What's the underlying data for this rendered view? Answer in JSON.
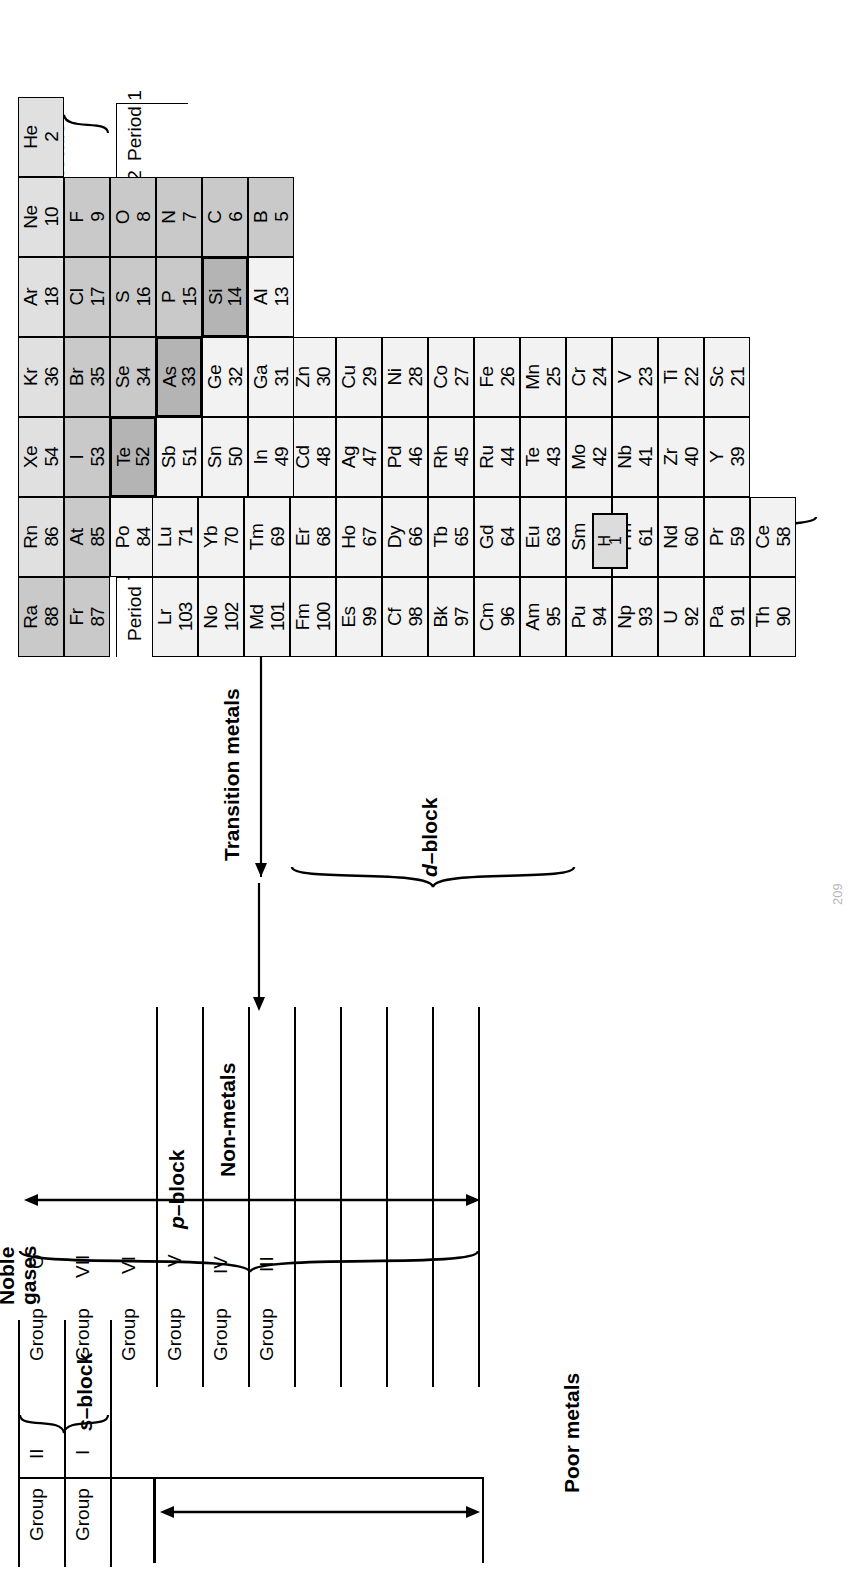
{
  "document": {
    "title": "Periodic Table of the Elements",
    "page_number": "209"
  },
  "group_labels": [
    {
      "word": "Group",
      "numeral": "I"
    },
    {
      "word": "Group",
      "numeral": "II"
    },
    {
      "word": "Group",
      "numeral": "III"
    },
    {
      "word": "Group",
      "numeral": "IV"
    },
    {
      "word": "Group",
      "numeral": "V"
    },
    {
      "word": "Group",
      "numeral": "VI"
    },
    {
      "word": "Group",
      "numeral": "VII"
    },
    {
      "word": "Group",
      "numeral": "O"
    }
  ],
  "period_labels": [
    "Period 1",
    "Period 2",
    "Period 3",
    "Period 4",
    "Period 5",
    "Period 6",
    "Period 7"
  ],
  "block_labels": {
    "s_block": "s-block",
    "p_block": "p-block",
    "d_block": "d-block",
    "f_block": "f-block"
  },
  "category_labels": {
    "reactive_metals": "Reactive\nmetals",
    "reactive_metals_line1": "Reactive",
    "reactive_metals_line2": "metals",
    "transition_metals": "Transition metals",
    "poor_metals": "Poor metals",
    "non_metals": "Non-metals",
    "noble_gases_line1": "Noble",
    "noble_gases_line2": "gases"
  },
  "colors": {
    "reactive_metal_fill": "#c9c9c9",
    "non_metal_fill": "#c9c9c9",
    "noble_gas_fill": "#e0e0e0",
    "poor_metal_fill": "#e0e0e0",
    "transition_fill": "#f2f2f2",
    "metalloid_fill": "#b4b4b4",
    "border": "#000000",
    "background": "#ffffff"
  },
  "chart_data": {
    "type": "table",
    "orientation": "rotated-90-counterclockwise",
    "groups": [
      "I",
      "II",
      "III",
      "IV",
      "V",
      "VI",
      "VII",
      "O"
    ],
    "periods": [
      "Period 1",
      "Period 2",
      "Period 3",
      "Period 4",
      "Period 5",
      "Period 6",
      "Period 7"
    ],
    "main_table": {
      "period1": [
        {
          "symbol": "H",
          "number": "1",
          "col": 1,
          "fill": "light",
          "standalone": true
        },
        {
          "symbol": "He",
          "number": "2",
          "col": 18,
          "fill": "noble"
        }
      ],
      "period2": [
        {
          "symbol": "Li",
          "number": "3",
          "col": 1,
          "fill": "mid"
        },
        {
          "symbol": "Be",
          "number": "4",
          "col": 2,
          "fill": "mid"
        },
        {
          "symbol": "B",
          "number": "5",
          "col": 13,
          "fill": "mid"
        },
        {
          "symbol": "C",
          "number": "6",
          "col": 14,
          "fill": "mid"
        },
        {
          "symbol": "N",
          "number": "7",
          "col": 15,
          "fill": "mid"
        },
        {
          "symbol": "O",
          "number": "8",
          "col": 16,
          "fill": "mid"
        },
        {
          "symbol": "F",
          "number": "9",
          "col": 17,
          "fill": "mid"
        },
        {
          "symbol": "Ne",
          "number": "10",
          "col": 18,
          "fill": "noble"
        }
      ],
      "period3": [
        {
          "symbol": "Na",
          "number": "11",
          "col": 1,
          "fill": "mid"
        },
        {
          "symbol": "Mg",
          "number": "12",
          "col": 2,
          "fill": "mid"
        },
        {
          "symbol": "Al",
          "number": "13",
          "col": 13,
          "fill": "light"
        },
        {
          "symbol": "Si",
          "number": "14",
          "col": 14,
          "fill": "dark"
        },
        {
          "symbol": "P",
          "number": "15",
          "col": 15,
          "fill": "mid"
        },
        {
          "symbol": "S",
          "number": "16",
          "col": 16,
          "fill": "mid"
        },
        {
          "symbol": "Cl",
          "number": "17",
          "col": 17,
          "fill": "mid"
        },
        {
          "symbol": "Ar",
          "number": "18",
          "col": 18,
          "fill": "noble"
        }
      ],
      "period4": [
        {
          "symbol": "K",
          "number": "19",
          "col": 1,
          "fill": "mid"
        },
        {
          "symbol": "Ca",
          "number": "20",
          "col": 2,
          "fill": "mid"
        },
        {
          "symbol": "Sc",
          "number": "21",
          "col": 3,
          "fill": "light"
        },
        {
          "symbol": "Ti",
          "number": "22",
          "col": 4,
          "fill": "light"
        },
        {
          "symbol": "V",
          "number": "23",
          "col": 5,
          "fill": "light"
        },
        {
          "symbol": "Cr",
          "number": "24",
          "col": 6,
          "fill": "light"
        },
        {
          "symbol": "Mn",
          "number": "25",
          "col": 7,
          "fill": "light"
        },
        {
          "symbol": "Fe",
          "number": "26",
          "col": 8,
          "fill": "light"
        },
        {
          "symbol": "Co",
          "number": "27",
          "col": 9,
          "fill": "light"
        },
        {
          "symbol": "Ni",
          "number": "28",
          "col": 10,
          "fill": "light"
        },
        {
          "symbol": "Cu",
          "number": "29",
          "col": 11,
          "fill": "light"
        },
        {
          "symbol": "Zn",
          "number": "30",
          "col": 12,
          "fill": "light"
        },
        {
          "symbol": "Ga",
          "number": "31",
          "col": 13,
          "fill": "light"
        },
        {
          "symbol": "Ge",
          "number": "32",
          "col": 14,
          "fill": "light"
        },
        {
          "symbol": "As",
          "number": "33",
          "col": 15,
          "fill": "dark"
        },
        {
          "symbol": "Se",
          "number": "34",
          "col": 16,
          "fill": "mid"
        },
        {
          "symbol": "Br",
          "number": "35",
          "col": 17,
          "fill": "mid"
        },
        {
          "symbol": "Kr",
          "number": "36",
          "col": 18,
          "fill": "noble"
        }
      ],
      "period5": [
        {
          "symbol": "Rb",
          "number": "37",
          "col": 1,
          "fill": "mid"
        },
        {
          "symbol": "Sr",
          "number": "38",
          "col": 2,
          "fill": "mid"
        },
        {
          "symbol": "Y",
          "number": "39",
          "col": 3,
          "fill": "light"
        },
        {
          "symbol": "Zr",
          "number": "40",
          "col": 4,
          "fill": "light"
        },
        {
          "symbol": "Nb",
          "number": "41",
          "col": 5,
          "fill": "light"
        },
        {
          "symbol": "Mo",
          "number": "42",
          "col": 6,
          "fill": "light"
        },
        {
          "symbol": "Te",
          "number": "43",
          "col": 7,
          "fill": "light"
        },
        {
          "symbol": "Ru",
          "number": "44",
          "col": 8,
          "fill": "light"
        },
        {
          "symbol": "Rh",
          "number": "45",
          "col": 9,
          "fill": "light"
        },
        {
          "symbol": "Pd",
          "number": "46",
          "col": 10,
          "fill": "light"
        },
        {
          "symbol": "Ag",
          "number": "47",
          "col": 11,
          "fill": "light"
        },
        {
          "symbol": "Cd",
          "number": "48",
          "col": 12,
          "fill": "light"
        },
        {
          "symbol": "In",
          "number": "49",
          "col": 13,
          "fill": "light"
        },
        {
          "symbol": "Sn",
          "number": "50",
          "col": 14,
          "fill": "light"
        },
        {
          "symbol": "Sb",
          "number": "51",
          "col": 15,
          "fill": "light"
        },
        {
          "symbol": "Te",
          "number": "52",
          "col": 16,
          "fill": "dark"
        },
        {
          "symbol": "I",
          "number": "53",
          "col": 17,
          "fill": "mid"
        },
        {
          "symbol": "Xe",
          "number": "54",
          "col": 18,
          "fill": "noble"
        }
      ],
      "period6": [
        {
          "symbol": "Cs",
          "number": "55",
          "col": 1,
          "fill": "mid"
        },
        {
          "symbol": "Ba",
          "number": "56",
          "col": 2,
          "fill": "mid"
        },
        {
          "symbol": "La",
          "number": "57",
          "col": 3,
          "fill": "light"
        },
        {
          "symbol": "Hf",
          "number": "72",
          "col": 4,
          "fill": "light"
        },
        {
          "symbol": "Ta",
          "number": "73",
          "col": 5,
          "fill": "light"
        },
        {
          "symbol": "W",
          "number": "74",
          "col": 6,
          "fill": "light"
        },
        {
          "symbol": "Re",
          "number": "75",
          "col": 7,
          "fill": "light"
        },
        {
          "symbol": "Os",
          "number": "76",
          "col": 8,
          "fill": "light"
        },
        {
          "symbol": "Ir",
          "number": "77",
          "col": 9,
          "fill": "light"
        },
        {
          "symbol": "Pt",
          "number": "78",
          "col": 10,
          "fill": "light"
        },
        {
          "symbol": "Au",
          "number": "79",
          "col": 11,
          "fill": "light"
        },
        {
          "symbol": "Hg",
          "number": "80",
          "col": 12,
          "fill": "light"
        },
        {
          "symbol": "Tl",
          "number": "81",
          "col": 13,
          "fill": "light"
        },
        {
          "symbol": "Pb",
          "number": "82",
          "col": 14,
          "fill": "light"
        },
        {
          "symbol": "Bi",
          "number": "83",
          "col": 15,
          "fill": "light"
        },
        {
          "symbol": "Po",
          "number": "84",
          "col": 16,
          "fill": "light"
        },
        {
          "symbol": "At",
          "number": "85",
          "col": 17,
          "fill": "mid"
        },
        {
          "symbol": "Rn",
          "number": "86",
          "col": 18,
          "fill": "noble"
        }
      ],
      "period7": [
        {
          "symbol": "Fr",
          "number": "87",
          "col": 1,
          "fill": "mid"
        },
        {
          "symbol": "Ra",
          "number": "88",
          "col": 2,
          "fill": "mid"
        },
        {
          "symbol": "Ac",
          "number": "89",
          "col": 3,
          "fill": "light"
        },
        {
          "symbol": "Ku",
          "number": "104",
          "col": 4,
          "fill": "light"
        },
        {
          "symbol": "Ha",
          "number": "105",
          "col": 5,
          "fill": "light"
        },
        {
          "symbol": "",
          "number": "",
          "col": 6,
          "fill": "white"
        },
        {
          "symbol": "",
          "number": "",
          "col": 7,
          "fill": "white"
        },
        {
          "symbol": "",
          "number": "",
          "col": 8,
          "fill": "white"
        },
        {
          "symbol": "*",
          "number": "109",
          "col": 9,
          "fill": "white"
        }
      ]
    },
    "lanthanides": [
      {
        "symbol": "Ce",
        "number": "58"
      },
      {
        "symbol": "Pr",
        "number": "59"
      },
      {
        "symbol": "Nd",
        "number": "60"
      },
      {
        "symbol": "Pm",
        "number": "61"
      },
      {
        "symbol": "Sm",
        "number": "62"
      },
      {
        "symbol": "Eu",
        "number": "63"
      },
      {
        "symbol": "Gd",
        "number": "64"
      },
      {
        "symbol": "Tb",
        "number": "65"
      },
      {
        "symbol": "Dy",
        "number": "66"
      },
      {
        "symbol": "Ho",
        "number": "67"
      },
      {
        "symbol": "Er",
        "number": "68"
      },
      {
        "symbol": "Tm",
        "number": "69"
      },
      {
        "symbol": "Yb",
        "number": "70"
      },
      {
        "symbol": "Lu",
        "number": "71"
      }
    ],
    "actinides": [
      {
        "symbol": "Th",
        "number": "90"
      },
      {
        "symbol": "Pa",
        "number": "91"
      },
      {
        "symbol": "U",
        "number": "92"
      },
      {
        "symbol": "Np",
        "number": "93"
      },
      {
        "symbol": "Pu",
        "number": "94"
      },
      {
        "symbol": "Am",
        "number": "95"
      },
      {
        "symbol": "Cm",
        "number": "96"
      },
      {
        "symbol": "Bk",
        "number": "97"
      },
      {
        "symbol": "Cf",
        "number": "98"
      },
      {
        "symbol": "Es",
        "number": "99"
      },
      {
        "symbol": "Fm",
        "number": "100"
      },
      {
        "symbol": "Md",
        "number": "101"
      },
      {
        "symbol": "No",
        "number": "102"
      },
      {
        "symbol": "Lr",
        "number": "103"
      }
    ]
  }
}
